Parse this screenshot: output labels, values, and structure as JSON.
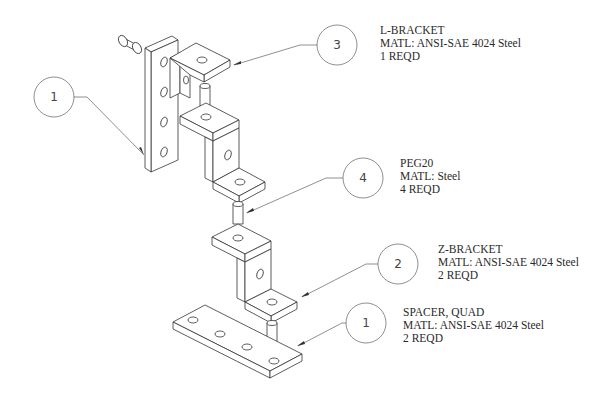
{
  "drawing": {
    "type": "exploded isometric assembly drawing",
    "background": "#ffffff",
    "line_color": "#333333"
  },
  "callouts": [
    {
      "balloon": "1",
      "name": "SPACER, QUAD",
      "material": "MATL: ANSI-SAE 4024 Steel",
      "qty": "2 REQD",
      "position": "left"
    },
    {
      "balloon": "3",
      "name": "L-BRACKET",
      "material": "MATL: ANSI-SAE 4024 Steel",
      "qty": "1 REQD"
    },
    {
      "balloon": "4",
      "name": "PEG20",
      "material": "MATL: Steel",
      "qty": "4 REQD"
    },
    {
      "balloon": "2",
      "name": "Z-BRACKET",
      "material": "MATL: ANSI-SAE 4024 Steel",
      "qty": "2 REQD"
    },
    {
      "balloon": "1",
      "name": "SPACER, QUAD",
      "material": "MATL: ANSI-SAE 4024 Steel",
      "qty": "2 REQD",
      "position": "bottom"
    }
  ],
  "labels": {
    "l_bracket": {
      "name": "L-BRACKET",
      "material": "MATL: ANSI-SAE 4024 Steel",
      "qty": "1 REQD"
    },
    "peg20": {
      "name": "PEG20",
      "material": "MATL: Steel",
      "qty": "4 REQD"
    },
    "z_bracket": {
      "name": "Z-BRACKET",
      "material": "MATL: ANSI-SAE 4024 Steel",
      "qty": "2 REQD"
    },
    "spacer_quad": {
      "name": "SPACER, QUAD",
      "material": "MATL: ANSI-SAE 4024 Steel",
      "qty": "2 REQD"
    }
  },
  "balloons": {
    "left_spacer": "1",
    "l_bracket": "3",
    "peg": "4",
    "z_bracket": "2",
    "bottom_spacer": "1"
  }
}
